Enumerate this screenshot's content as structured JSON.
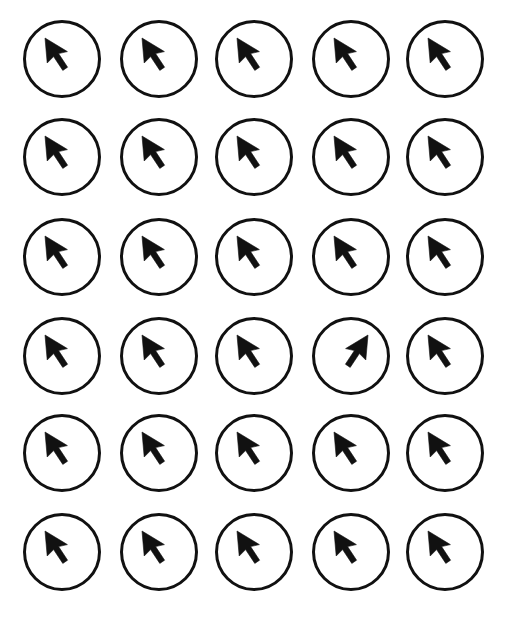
{
  "stimulus": {
    "title": "Cursor Orientation Search Array",
    "type": "visual-search-grid",
    "background_color": "#ffffff",
    "ink_color": "#111111",
    "canvas": {
      "width": 508,
      "height": 620
    },
    "grid": {
      "columns": 5,
      "rows": 6,
      "total_items": 30,
      "column_x": [
        22,
        119,
        214,
        311,
        405
      ],
      "row_y": [
        19,
        117,
        217,
        316,
        413,
        512
      ],
      "cell_size": 80,
      "circle_diameter": 78,
      "circle_stroke_width": 3
    },
    "icon": {
      "name": "mouse-cursor-arrow",
      "default_orientation": "upper-left",
      "odd_orientation": "upper-right",
      "description": "Filled arrow pointer with triangular head and straight tail"
    },
    "odd_one_out": {
      "present": true,
      "row": 4,
      "column": 4,
      "index": 18,
      "orientation": "upper-right",
      "note": "Mirrored cursor; all other cursors point upper-left"
    },
    "items": [
      {
        "row": 1,
        "col": 1,
        "orientation": "upper-left",
        "odd": false
      },
      {
        "row": 1,
        "col": 2,
        "orientation": "upper-left",
        "odd": false
      },
      {
        "row": 1,
        "col": 3,
        "orientation": "upper-left",
        "odd": false
      },
      {
        "row": 1,
        "col": 4,
        "orientation": "upper-left",
        "odd": false
      },
      {
        "row": 1,
        "col": 5,
        "orientation": "upper-left",
        "odd": false
      },
      {
        "row": 2,
        "col": 1,
        "orientation": "upper-left",
        "odd": false
      },
      {
        "row": 2,
        "col": 2,
        "orientation": "upper-left",
        "odd": false
      },
      {
        "row": 2,
        "col": 3,
        "orientation": "upper-left",
        "odd": false
      },
      {
        "row": 2,
        "col": 4,
        "orientation": "upper-left",
        "odd": false
      },
      {
        "row": 2,
        "col": 5,
        "orientation": "upper-left",
        "odd": false
      },
      {
        "row": 3,
        "col": 1,
        "orientation": "upper-left",
        "odd": false
      },
      {
        "row": 3,
        "col": 2,
        "orientation": "upper-left",
        "odd": false
      },
      {
        "row": 3,
        "col": 3,
        "orientation": "upper-left",
        "odd": false
      },
      {
        "row": 3,
        "col": 4,
        "orientation": "upper-left",
        "odd": false
      },
      {
        "row": 3,
        "col": 5,
        "orientation": "upper-left",
        "odd": false
      },
      {
        "row": 4,
        "col": 1,
        "orientation": "upper-left",
        "odd": false
      },
      {
        "row": 4,
        "col": 2,
        "orientation": "upper-left",
        "odd": false
      },
      {
        "row": 4,
        "col": 3,
        "orientation": "upper-left",
        "odd": false
      },
      {
        "row": 4,
        "col": 4,
        "orientation": "upper-right",
        "odd": true
      },
      {
        "row": 4,
        "col": 5,
        "orientation": "upper-left",
        "odd": false
      },
      {
        "row": 5,
        "col": 1,
        "orientation": "upper-left",
        "odd": false
      },
      {
        "row": 5,
        "col": 2,
        "orientation": "upper-left",
        "odd": false
      },
      {
        "row": 5,
        "col": 3,
        "orientation": "upper-left",
        "odd": false
      },
      {
        "row": 5,
        "col": 4,
        "orientation": "upper-left",
        "odd": false
      },
      {
        "row": 5,
        "col": 5,
        "orientation": "upper-left",
        "odd": false
      },
      {
        "row": 6,
        "col": 1,
        "orientation": "upper-left",
        "odd": false
      },
      {
        "row": 6,
        "col": 2,
        "orientation": "upper-left",
        "odd": false
      },
      {
        "row": 6,
        "col": 3,
        "orientation": "upper-left",
        "odd": false
      },
      {
        "row": 6,
        "col": 4,
        "orientation": "upper-left",
        "odd": false
      },
      {
        "row": 6,
        "col": 5,
        "orientation": "upper-left",
        "odd": false
      }
    ]
  }
}
